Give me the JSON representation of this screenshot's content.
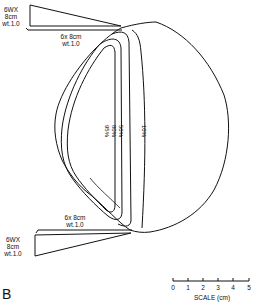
{
  "figure": {
    "panel_label": "B",
    "top_wedge": {
      "label_line1": "6WX",
      "label_line2": "8cm",
      "label_line3": "wt.1.0"
    },
    "top_field": {
      "label_line1": "6x 8cm",
      "label_line2": "wt.1.0"
    },
    "bottom_field": {
      "label_line1": "6x 8cm",
      "label_line2": "wt.1.0"
    },
    "bottom_wedge": {
      "label_line1": "6WX",
      "label_line2": "8cm",
      "label_line3": "wt.1.0"
    },
    "isodose_labels": [
      "95%",
      "80%",
      "50%",
      "10%"
    ],
    "scale": {
      "ticks": [
        "0",
        "1",
        "2",
        "3",
        "4",
        "5"
      ],
      "title": "SCALE (cm)"
    },
    "colors": {
      "line": "#111111",
      "background": "#ffffff"
    }
  }
}
